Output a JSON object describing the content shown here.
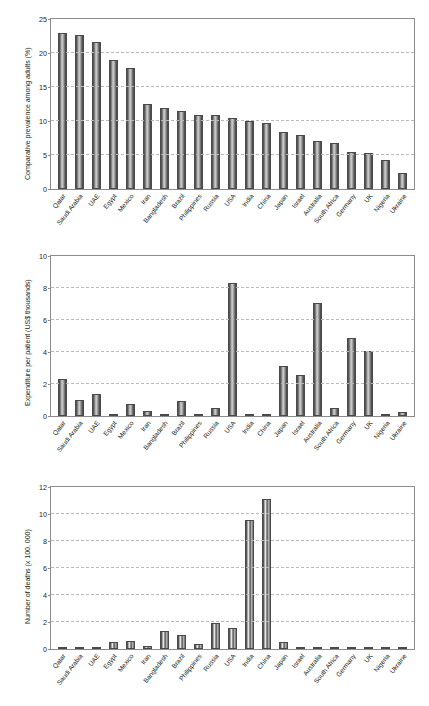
{
  "figure": {
    "background": "#ffffff",
    "bar_color": "#6a6a6a",
    "grid_color": "#b9b9b9",
    "axis_color": "#8c8c8c",
    "caption": ""
  },
  "categories": [
    "Qatar",
    "Saudi Arabia",
    "UAE",
    "Egypt",
    "Mexico",
    "Iran",
    "Bangladesh",
    "Brazil",
    "Philippines",
    "Russia",
    "USA",
    "India",
    "China",
    "Japan",
    "Israel",
    "Australia",
    "South Africa",
    "Germany",
    "UK",
    "Nigeria",
    "Ukraine"
  ],
  "chart_data": [
    {
      "type": "bar",
      "title": "",
      "xlabel": "",
      "ylabel": "Comparative prevalence among adults (%)",
      "ylim": [
        0,
        25
      ],
      "yticks": [
        0,
        5,
        10,
        15,
        20,
        25
      ],
      "grid": true,
      "legend": "none",
      "categories": [
        "Qatar",
        "Saudi Arabia",
        "UAE",
        "Egypt",
        "Mexico",
        "Iran",
        "Bangladesh",
        "Brazil",
        "Philippines",
        "Russia",
        "USA",
        "India",
        "China",
        "Japan",
        "Israel",
        "Australia",
        "South Africa",
        "Germany",
        "UK",
        "Nigeria",
        "Ukraine"
      ],
      "values": [
        22.9,
        22.6,
        21.6,
        19.0,
        17.8,
        12.5,
        11.9,
        11.5,
        10.9,
        10.9,
        10.4,
        10.0,
        9.7,
        8.4,
        8.0,
        7.1,
        6.8,
        5.5,
        5.3,
        4.3,
        2.4
      ]
    },
    {
      "type": "bar",
      "title": "",
      "xlabel": "",
      "ylabel": "Expenditure per patient (US$ thousands)",
      "ylim": [
        0,
        10
      ],
      "yticks": [
        0,
        2,
        4,
        6,
        8,
        10
      ],
      "grid": true,
      "legend": "none",
      "categories": [
        "Qatar",
        "Saudi Arabia",
        "UAE",
        "Egypt",
        "Mexico",
        "Iran",
        "Bangladesh",
        "Brazil",
        "Philippines",
        "Russia",
        "USA",
        "India",
        "China",
        "Japan",
        "Israel",
        "Australia",
        "South Africa",
        "Germany",
        "UK",
        "Nigeria",
        "Ukraine"
      ],
      "values": [
        2.3,
        1.0,
        1.35,
        0.12,
        0.75,
        0.33,
        0.03,
        0.95,
        0.07,
        0.52,
        8.3,
        0.03,
        0.08,
        3.1,
        2.55,
        7.05,
        0.52,
        4.85,
        4.05,
        0.02,
        0.24
      ]
    },
    {
      "type": "bar",
      "title": "",
      "xlabel": "",
      "ylabel": "Number of deaths (x 100, 000)",
      "ylim": [
        0,
        12
      ],
      "yticks": [
        0,
        2,
        4,
        6,
        8,
        10,
        12
      ],
      "grid": true,
      "legend": "none",
      "categories": [
        "Qatar",
        "Saudi Arabia",
        "UAE",
        "Egypt",
        "Mexico",
        "Iran",
        "Bangladesh",
        "Brazil",
        "Philippines",
        "Russia",
        "USA",
        "India",
        "China",
        "Japan",
        "Israel",
        "Australia",
        "South Africa",
        "Germany",
        "UK",
        "Nigeria",
        "Ukraine"
      ],
      "values": [
        0.01,
        0.04,
        0.02,
        0.55,
        0.58,
        0.2,
        1.3,
        1.05,
        0.4,
        1.95,
        1.55,
        9.55,
        11.1,
        0.55,
        0.03,
        0.03,
        0.02,
        0.15,
        0.06,
        0.03,
        0.04
      ]
    }
  ]
}
